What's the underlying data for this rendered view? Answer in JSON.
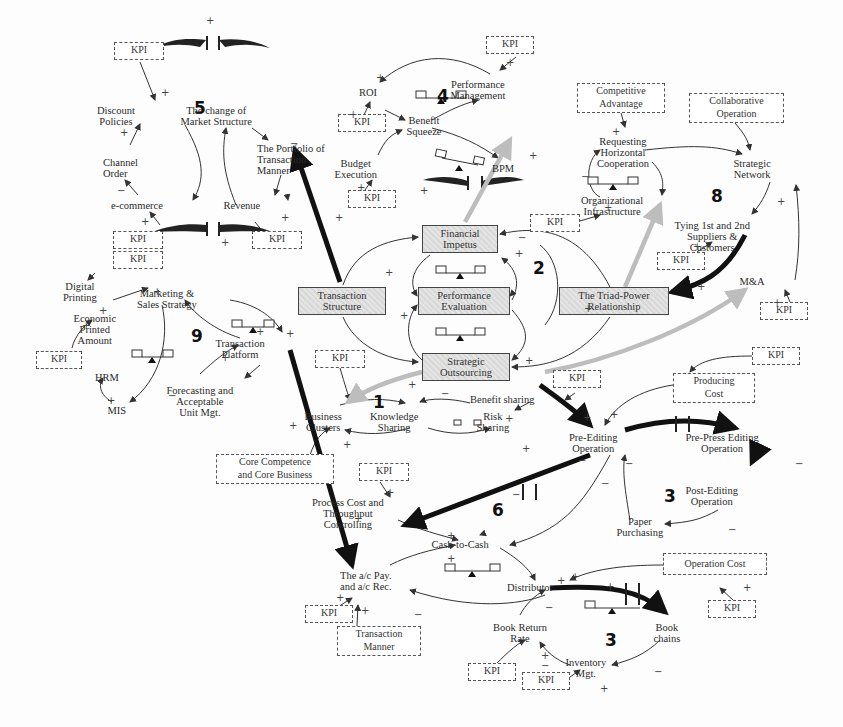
{
  "diagram": {
    "type": "causal-loop-diagram",
    "colors": {
      "arrow": "#333333",
      "thick_arrow": "#111111",
      "gray_arrow": "#bdbdbd",
      "box_fill": "#dcdcdc"
    },
    "loop_numbers": [
      {
        "id": "loop5",
        "label": "5",
        "x": 194,
        "y": 105
      },
      {
        "id": "loop4",
        "label": "4",
        "x": 437,
        "y": 101
      },
      {
        "id": "loop8",
        "label": "8",
        "x": 711,
        "y": 191
      },
      {
        "id": "loop2",
        "label": "2",
        "x": 533,
        "y": 262
      },
      {
        "id": "loop9",
        "label": "9",
        "x": 191,
        "y": 328
      },
      {
        "id": "loop1",
        "label": "1",
        "x": 373,
        "y": 395
      },
      {
        "id": "loop6",
        "label": "6",
        "x": 492,
        "y": 504
      },
      {
        "id": "loop3a",
        "label": "3",
        "x": 664,
        "y": 486
      },
      {
        "id": "loop3b",
        "label": "3",
        "x": 605,
        "y": 637
      }
    ],
    "nodes": [
      {
        "id": "discount-policies",
        "text": "Discount\nPolicies",
        "x": 139,
        "y": 107
      },
      {
        "id": "market-structure",
        "text": "The change of\nMarket Structure",
        "x": 216,
        "y": 107
      },
      {
        "id": "portfolio-transaction",
        "text": "The Portfolio of\nTransaction\nManner",
        "x": 257,
        "y": 146
      },
      {
        "id": "channel-order",
        "text": "Channel\nOrder",
        "x": 110,
        "y": 159
      },
      {
        "id": "e-commerce",
        "text": "e-commerce",
        "x": 137,
        "y": 200
      },
      {
        "id": "revenue",
        "text": "Revenue",
        "x": 242,
        "y": 200
      },
      {
        "id": "roi",
        "text": "ROI",
        "x": 368,
        "y": 92
      },
      {
        "id": "performance-management",
        "text": "Performance\nManagement",
        "x": 478,
        "y": 81
      },
      {
        "id": "benefit-squeeze",
        "text": "Benefit\nSqueeze",
        "x": 414,
        "y": 118
      },
      {
        "id": "budget-execution",
        "text": "Budget\nExecution",
        "x": 356,
        "y": 160
      },
      {
        "id": "bpm",
        "text": "BPM",
        "x": 503,
        "y": 164
      },
      {
        "id": "requesting-horizontal",
        "text": "Requesting\nHorizontal\nCooperation",
        "x": 611,
        "y": 141
      },
      {
        "id": "strategic-network",
        "text": "Strategic\nNetwork",
        "x": 751,
        "y": 160
      },
      {
        "id": "organizational-infrastructure",
        "text": "Organizational\nInfrastructure",
        "x": 610,
        "y": 196
      },
      {
        "id": "tying-suppliers",
        "text": "Tying 1st and 2nd\nSuppliers &\nCustomers",
        "x": 713,
        "y": 222
      },
      {
        "id": "m-and-a",
        "text": "M&A",
        "x": 751,
        "y": 279
      },
      {
        "id": "digital-printing",
        "text": "Digital\nPrinting",
        "x": 84,
        "y": 284
      },
      {
        "id": "marketing-sales",
        "text": "Marketing &\nSales Strategy",
        "x": 165,
        "y": 289
      },
      {
        "id": "economic-printed",
        "text": "Economic\nPrinted\nAmount",
        "x": 95,
        "y": 314
      },
      {
        "id": "transaction-platform",
        "text": "Transaction\nPlatform",
        "x": 240,
        "y": 338
      },
      {
        "id": "hrm",
        "text": "HRM",
        "x": 107,
        "y": 371
      },
      {
        "id": "forecasting",
        "text": "Forecasting and\nAcceptable\nUnit Mgt.",
        "x": 200,
        "y": 385
      },
      {
        "id": "mis",
        "text": "MIS",
        "x": 120,
        "y": 405
      },
      {
        "id": "business-clusters",
        "text": "Business\nClusters",
        "x": 322,
        "y": 413
      },
      {
        "id": "knowledge-sharing",
        "text": "Knowledge\nSharing",
        "x": 393,
        "y": 413
      },
      {
        "id": "risk-sharing",
        "text": "Risk\nSharing",
        "x": 492,
        "y": 413
      },
      {
        "id": "benefit-sharing",
        "text": "Benefit sharing",
        "x": 507,
        "y": 395
      },
      {
        "id": "pre-editing",
        "text": "Pre-Editing\nOperation",
        "x": 594,
        "y": 434
      },
      {
        "id": "pre-press",
        "text": "Pre-Press Editing\nOperation",
        "x": 722,
        "y": 434
      },
      {
        "id": "post-editing",
        "text": "Post-Editing\nOperation",
        "x": 712,
        "y": 486
      },
      {
        "id": "paper-purchasing",
        "text": "Paper\nPurchasing",
        "x": 640,
        "y": 519
      },
      {
        "id": "process-cost",
        "text": "Process Cost and\nThroughput\nControlling",
        "x": 346,
        "y": 500
      },
      {
        "id": "cash-to-cash",
        "text": "Cash-to-Cash",
        "x": 459,
        "y": 540
      },
      {
        "id": "ac-pay",
        "text": "The a/c Pay.\nand a/c Rec.",
        "x": 366,
        "y": 572
      },
      {
        "id": "distributor",
        "text": "Distributor",
        "x": 531,
        "y": 583
      },
      {
        "id": "book-return",
        "text": "Book Return\nRate",
        "x": 522,
        "y": 624
      },
      {
        "id": "book-chains",
        "text": "Book\nchains",
        "x": 667,
        "y": 624
      },
      {
        "id": "inventory-mgt",
        "text": "Inventory\nMgt.",
        "x": 585,
        "y": 656
      }
    ],
    "strategic_boxes": [
      {
        "id": "financial-impetus",
        "text": "Financial\nImpetus",
        "x": 422,
        "y": 225,
        "w": 76,
        "h": 28
      },
      {
        "id": "transaction-structure",
        "text": "Transaction\nStructure",
        "x": 298,
        "y": 287,
        "w": 88,
        "h": 28
      },
      {
        "id": "performance-evaluation",
        "text": "Performance\nEvaluation",
        "x": 418,
        "y": 287,
        "w": 92,
        "h": 28
      },
      {
        "id": "triad-power",
        "text": "The Triad-Power\nRelationship",
        "x": 559,
        "y": 287,
        "w": 110,
        "h": 28
      },
      {
        "id": "strategic-outsourcing",
        "text": "Strategic\nOutsourcing",
        "x": 422,
        "y": 353,
        "w": 88,
        "h": 28
      }
    ],
    "external_boxes": [
      {
        "id": "kpi-1",
        "text": "KPI",
        "x": 114,
        "y": 42,
        "w": 50,
        "h": 18
      },
      {
        "id": "kpi-2",
        "text": "KPI",
        "x": 486,
        "y": 36,
        "w": 48,
        "h": 18
      },
      {
        "id": "kpi-3",
        "text": "KPI",
        "x": 338,
        "y": 114,
        "w": 48,
        "h": 18
      },
      {
        "id": "kpi-4",
        "text": "KPI",
        "x": 348,
        "y": 190,
        "w": 48,
        "h": 18
      },
      {
        "id": "competitive-advantage",
        "text": "Competitive\nAdvantage",
        "x": 577,
        "y": 83,
        "w": 88,
        "h": 30
      },
      {
        "id": "collaborative-operation",
        "text": "Collaborative\nOperation",
        "x": 689,
        "y": 93,
        "w": 95,
        "h": 30
      },
      {
        "id": "kpi-5",
        "text": "KPI",
        "x": 530,
        "y": 214,
        "w": 50,
        "h": 18
      },
      {
        "id": "kpi-6",
        "text": "KPI",
        "x": 657,
        "y": 252,
        "w": 48,
        "h": 18
      },
      {
        "id": "kpi-7",
        "text": "KPI",
        "x": 113,
        "y": 231,
        "w": 50,
        "h": 18
      },
      {
        "id": "kpi-8",
        "text": "KPI",
        "x": 252,
        "y": 231,
        "w": 50,
        "h": 18
      },
      {
        "id": "kpi-9",
        "text": "KPI",
        "x": 113,
        "y": 251,
        "w": 50,
        "h": 18
      },
      {
        "id": "kpi-10",
        "text": "KPI",
        "x": 760,
        "y": 302,
        "w": 48,
        "h": 18
      },
      {
        "id": "kpi-11",
        "text": "KPI",
        "x": 36,
        "y": 351,
        "w": 46,
        "h": 18
      },
      {
        "id": "kpi-12",
        "text": "KPI",
        "x": 315,
        "y": 350,
        "w": 50,
        "h": 18
      },
      {
        "id": "kpi-13",
        "text": "KPI",
        "x": 752,
        "y": 347,
        "w": 48,
        "h": 18
      },
      {
        "id": "kpi-14",
        "text": "KPI",
        "x": 553,
        "y": 370,
        "w": 48,
        "h": 18
      },
      {
        "id": "producing-cost",
        "text": "Producing\nCost",
        "x": 673,
        "y": 373,
        "w": 82,
        "h": 30
      },
      {
        "id": "core-competence",
        "text": "Core Competence\nand Core Business",
        "x": 216,
        "y": 454,
        "w": 118,
        "h": 30
      },
      {
        "id": "kpi-15",
        "text": "KPI",
        "x": 359,
        "y": 463,
        "w": 50,
        "h": 18
      },
      {
        "id": "operation-cost",
        "text": "Operation Cost",
        "x": 663,
        "y": 553,
        "w": 104,
        "h": 22
      },
      {
        "id": "transaction-manner",
        "text": "Transaction\nManner",
        "x": 337,
        "y": 626,
        "w": 84,
        "h": 30
      },
      {
        "id": "kpi-16",
        "text": "KPI",
        "x": 305,
        "y": 605,
        "w": 48,
        "h": 18
      },
      {
        "id": "kpi-17",
        "text": "KPI",
        "x": 708,
        "y": 600,
        "w": 48,
        "h": 18
      },
      {
        "id": "kpi-18",
        "text": "KPI",
        "x": 468,
        "y": 663,
        "w": 48,
        "h": 18
      },
      {
        "id": "kpi-19",
        "text": "KPI",
        "x": 522,
        "y": 672,
        "w": 48,
        "h": 18
      }
    ],
    "signs": [
      {
        "t": "+",
        "x": 206,
        "y": 15
      },
      {
        "t": "+",
        "x": 161,
        "y": 87
      },
      {
        "t": "+",
        "x": 120,
        "y": 127
      },
      {
        "t": "−",
        "x": 117,
        "y": 185
      },
      {
        "t": "+",
        "x": 141,
        "y": 216
      },
      {
        "t": "+",
        "x": 221,
        "y": 237
      },
      {
        "t": "+",
        "x": 281,
        "y": 212
      },
      {
        "t": "−",
        "x": 290,
        "y": 138
      },
      {
        "t": "+",
        "x": 376,
        "y": 72
      },
      {
        "t": "+",
        "x": 349,
        "y": 109
      },
      {
        "t": "+",
        "x": 357,
        "y": 182
      },
      {
        "t": "+",
        "x": 420,
        "y": 185
      },
      {
        "t": "+",
        "x": 506,
        "y": 57
      },
      {
        "t": "+",
        "x": 529,
        "y": 150
      },
      {
        "t": "+",
        "x": 612,
        "y": 126
      },
      {
        "t": "−",
        "x": 581,
        "y": 171
      },
      {
        "t": "+",
        "x": 604,
        "y": 202
      },
      {
        "t": "+",
        "x": 777,
        "y": 196
      },
      {
        "t": "+",
        "x": 693,
        "y": 241
      },
      {
        "t": "+",
        "x": 773,
        "y": 297
      },
      {
        "t": "+",
        "x": 335,
        "y": 212
      },
      {
        "t": "+",
        "x": 385,
        "y": 267
      },
      {
        "t": "+",
        "x": 400,
        "y": 310
      },
      {
        "t": "+",
        "x": 515,
        "y": 248
      },
      {
        "t": "+",
        "x": 525,
        "y": 355
      },
      {
        "t": "−",
        "x": 518,
        "y": 232
      },
      {
        "t": "+",
        "x": 697,
        "y": 281
      },
      {
        "t": "+",
        "x": 584,
        "y": 303
      },
      {
        "t": "+",
        "x": 153,
        "y": 286
      },
      {
        "t": "+",
        "x": 99,
        "y": 305
      },
      {
        "t": "+",
        "x": 82,
        "y": 320
      },
      {
        "t": "+",
        "x": 256,
        "y": 326
      },
      {
        "t": "+",
        "x": 286,
        "y": 328
      },
      {
        "t": "+",
        "x": 221,
        "y": 352
      },
      {
        "t": "+",
        "x": 107,
        "y": 395
      },
      {
        "t": "−",
        "x": 168,
        "y": 390
      },
      {
        "t": "+",
        "x": 289,
        "y": 420
      },
      {
        "t": "+",
        "x": 343,
        "y": 439
      },
      {
        "t": "+",
        "x": 408,
        "y": 379
      },
      {
        "t": "−",
        "x": 441,
        "y": 388
      },
      {
        "t": "+",
        "x": 505,
        "y": 413
      },
      {
        "t": "+",
        "x": 522,
        "y": 443
      },
      {
        "t": "+",
        "x": 583,
        "y": 412
      },
      {
        "t": "−",
        "x": 578,
        "y": 455
      },
      {
        "t": "+",
        "x": 610,
        "y": 409
      },
      {
        "t": "−",
        "x": 625,
        "y": 458
      },
      {
        "t": "−",
        "x": 795,
        "y": 458
      },
      {
        "t": "−",
        "x": 728,
        "y": 524
      },
      {
        "t": "−",
        "x": 601,
        "y": 478
      },
      {
        "t": "+",
        "x": 386,
        "y": 487
      },
      {
        "t": "−",
        "x": 512,
        "y": 489
      },
      {
        "t": "+",
        "x": 447,
        "y": 530
      },
      {
        "t": "+",
        "x": 447,
        "y": 553
      },
      {
        "t": "+",
        "x": 557,
        "y": 575
      },
      {
        "t": "+",
        "x": 571,
        "y": 571
      },
      {
        "t": "+",
        "x": 354,
        "y": 513
      },
      {
        "t": "+",
        "x": 336,
        "y": 592
      },
      {
        "t": "+",
        "x": 361,
        "y": 605
      },
      {
        "t": "−",
        "x": 414,
        "y": 609
      },
      {
        "t": "−",
        "x": 545,
        "y": 602
      },
      {
        "t": "+",
        "x": 541,
        "y": 650
      },
      {
        "t": "−",
        "x": 541,
        "y": 660
      },
      {
        "t": "+",
        "x": 600,
        "y": 683
      },
      {
        "t": "−",
        "x": 654,
        "y": 666
      },
      {
        "t": "+",
        "x": 743,
        "y": 582
      },
      {
        "t": "+",
        "x": 606,
        "y": 581
      }
    ]
  }
}
